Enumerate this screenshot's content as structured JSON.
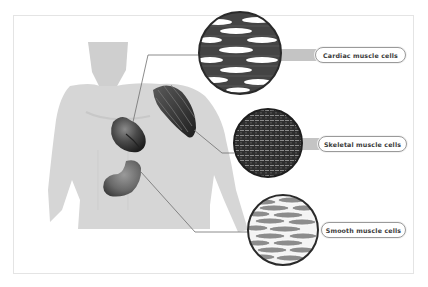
{
  "diagram": {
    "organs": [
      {
        "id": "heart",
        "name": "heart"
      },
      {
        "id": "stomach",
        "name": "stomach"
      },
      {
        "id": "deltoid",
        "name": "shoulder-muscle"
      }
    ],
    "callouts": [
      {
        "id": "cardiac",
        "label": "Cardiac muscle cells",
        "source": "heart",
        "texture": "branched-striated"
      },
      {
        "id": "skeletal",
        "label": "Skeletal muscle cells",
        "source": "shoulder-muscle",
        "texture": "striated-grid"
      },
      {
        "id": "smooth",
        "label": "Smooth muscle cells",
        "source": "stomach",
        "texture": "spindle-cells"
      }
    ],
    "colors": {
      "body": "#d4d4d4",
      "organ": "#4a4a4a",
      "line": "#6e6e6e",
      "label_border": "#9a9a9a",
      "label_text": "#3a3a3a",
      "bar": "#c4c4c4"
    }
  }
}
